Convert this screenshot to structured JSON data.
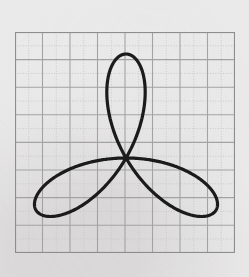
{
  "page": {
    "background_color": "#ebeaea",
    "width": 249,
    "height": 277
  },
  "plot": {
    "frame": {
      "x": 15,
      "y": 32,
      "width": 220,
      "height": 221
    },
    "frame_color": "#8d8d8d",
    "grid": {
      "columns": 8,
      "rows": 8,
      "cell_width": 27.5,
      "cell_height": 27.6,
      "major_color": "#a6a6a6",
      "minor_color": "#c9c9c9",
      "minor_style": "dotted",
      "visible": true
    },
    "axes": {
      "tick_labels_visible": false,
      "axis_labels_visible": false,
      "title_visible": false
    }
  },
  "chart_data": {
    "type": "line",
    "title": "",
    "subtitle": "",
    "xlabel": "",
    "ylabel": "",
    "grid": true,
    "legend": null,
    "legend_position": "none",
    "curve_family": "polar rose",
    "equation": "r = a*cos(3*theta)",
    "petal_count": 3,
    "amplitude_a": 104,
    "center_px": {
      "x": 126,
      "y": 158
    },
    "center_plot_units": {
      "x": 0,
      "y": 0
    },
    "orientation_deg": 90,
    "xlim": [
      -4,
      4
    ],
    "ylim": [
      -4,
      4
    ],
    "xticks": [
      -4,
      -3,
      -2,
      -1,
      0,
      1,
      2,
      3,
      4
    ],
    "yticks": [
      -4,
      -3,
      -2,
      -1,
      0,
      1,
      2,
      3,
      4
    ],
    "stroke_color": "#1b1b1b",
    "stroke_width": 3.2,
    "series": [
      {
        "name": "r = a*cos(3θ)",
        "petal_tip_angles_deg": [
          90,
          210,
          330
        ],
        "petal_tips_px": [
          {
            "x": 126,
            "y": 54
          },
          {
            "x": 36,
            "y": 210
          },
          {
            "x": 216,
            "y": 210
          }
        ],
        "extents_px": {
          "top": 54,
          "bottom": 212,
          "left": 44,
          "right": 208
        }
      }
    ],
    "annotations": []
  }
}
